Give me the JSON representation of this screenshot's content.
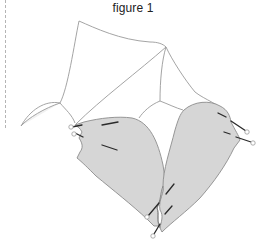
{
  "figure": {
    "caption": "figure 1",
    "colors": {
      "outline": "#9a9a9a",
      "shaded_fill": "#d6d6d6",
      "shaded_stroke": "#8c8c8c",
      "pin_line": "#2a2a2a",
      "pin_head": "#ffffff",
      "margin_rule": "#b5b5b5"
    },
    "elements": {
      "unshaded_flap": "outline piece",
      "left_shaded_piece": "shaded piece",
      "right_shaded_piece": "shaded piece",
      "pins_count": 11
    }
  }
}
